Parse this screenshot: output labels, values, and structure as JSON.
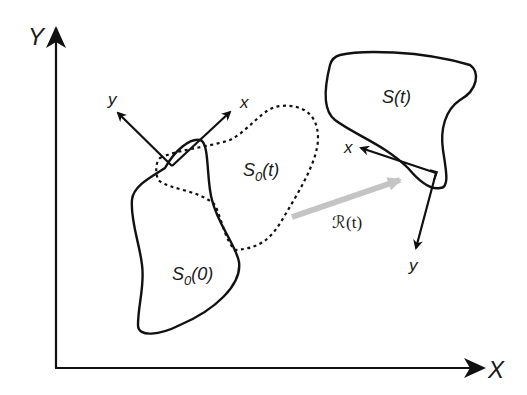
{
  "diagram": {
    "type": "rigid-body-motion",
    "world_axes": {
      "x_label": "X",
      "y_label": "Y"
    },
    "body_initial": {
      "label_main": "S",
      "label_sub": "0",
      "label_arg": "(0)",
      "frame": {
        "x_label": "x",
        "y_label": "y"
      }
    },
    "body_translated": {
      "label_main": "S",
      "label_sub": "0",
      "label_arg": "(t)",
      "style": "dotted"
    },
    "body_final": {
      "label": "S(t)",
      "frame": {
        "x_label": "x",
        "y_label": "y"
      }
    },
    "rotation": {
      "label": "ℛ(t)",
      "arrow_color": "#c4c4c4"
    },
    "colors": {
      "stroke": "#111111",
      "rotation_arrow": "#c4c4c4",
      "background": "#ffffff"
    }
  }
}
